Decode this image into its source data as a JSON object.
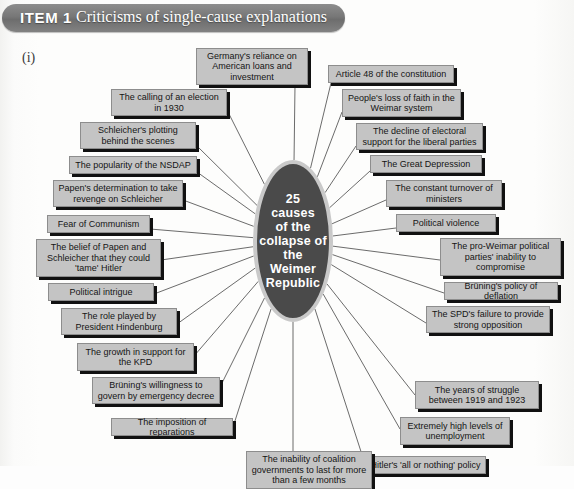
{
  "header": {
    "item_label": "ITEM 1",
    "title": "Criticisms of single-cause explanations",
    "pill_color": "#777777"
  },
  "section_marker": "(i)",
  "diagram": {
    "type": "mind-map",
    "center": {
      "label": "25 causes of the collapse of the Weimer Republic",
      "fill_color": "#4a4a4a",
      "ring_color": "#c9c9c9",
      "text_color": "#ffffff"
    },
    "box_style": {
      "fill_color": "#c4c4c4",
      "border_color": "#8d8d8d",
      "shadow_color": "#111111",
      "text_color": "#141414"
    },
    "causes": [
      {
        "id": "c01",
        "label": "Germany's reliance on American loans and investment",
        "x": 196,
        "y": 14,
        "w": 112,
        "h": 37,
        "anchor_x": 295,
        "anchor_y": 51
      },
      {
        "id": "c02",
        "label": "Article 48 of the constitution",
        "x": 328,
        "y": 31,
        "w": 126,
        "h": 18,
        "anchor_x": 331,
        "anchor_y": 49
      },
      {
        "id": "c03",
        "label": "The calling of an election in 1930",
        "x": 111,
        "y": 55,
        "w": 116,
        "h": 27,
        "anchor_x": 227,
        "anchor_y": 76
      },
      {
        "id": "c04",
        "label": "People's loss of faith in the Weimar system",
        "x": 342,
        "y": 55,
        "w": 119,
        "h": 28,
        "anchor_x": 342,
        "anchor_y": 78
      },
      {
        "id": "c05",
        "label": "Schleicher's plotting behind the scenes",
        "x": 80,
        "y": 88,
        "w": 116,
        "h": 27,
        "anchor_x": 196,
        "anchor_y": 111
      },
      {
        "id": "c06",
        "label": "The decline of electoral support for the liberal parties",
        "x": 356,
        "y": 89,
        "w": 127,
        "h": 27,
        "anchor_x": 356,
        "anchor_y": 112
      },
      {
        "id": "c07",
        "label": "The popularity of the NSDAP",
        "x": 69,
        "y": 122,
        "w": 128,
        "h": 18,
        "anchor_x": 197,
        "anchor_y": 138
      },
      {
        "id": "c08",
        "label": "The Great Depression",
        "x": 370,
        "y": 121,
        "w": 112,
        "h": 18,
        "anchor_x": 370,
        "anchor_y": 137
      },
      {
        "id": "c09",
        "label": "Papen's determination to take revenge on Schleicher",
        "x": 53,
        "y": 146,
        "w": 130,
        "h": 27,
        "anchor_x": 183,
        "anchor_y": 166
      },
      {
        "id": "c10",
        "label": "The constant turnover of ministers",
        "x": 386,
        "y": 146,
        "w": 116,
        "h": 27,
        "anchor_x": 386,
        "anchor_y": 166
      },
      {
        "id": "c11",
        "label": "Fear of Communism",
        "x": 47,
        "y": 181,
        "w": 103,
        "h": 18,
        "anchor_x": 150,
        "anchor_y": 195
      },
      {
        "id": "c12",
        "label": "Political violence",
        "x": 396,
        "y": 180,
        "w": 100,
        "h": 18,
        "anchor_x": 396,
        "anchor_y": 194
      },
      {
        "id": "c13",
        "label": "The belief of Papen and Schleicher that they could 'tame' Hitler",
        "x": 36,
        "y": 205,
        "w": 125,
        "h": 38,
        "anchor_x": 161,
        "anchor_y": 226
      },
      {
        "id": "c14",
        "label": "The pro-Weimar political parties' inability to compromise",
        "x": 440,
        "y": 204,
        "w": 121,
        "h": 38,
        "anchor_x": 440,
        "anchor_y": 226
      },
      {
        "id": "c15",
        "label": "Political intrigue",
        "x": 48,
        "y": 249,
        "w": 106,
        "h": 18,
        "anchor_x": 154,
        "anchor_y": 260
      },
      {
        "id": "c16",
        "label": "Brüning's policy of deflation",
        "x": 444,
        "y": 248,
        "w": 114,
        "h": 18,
        "anchor_x": 444,
        "anchor_y": 259
      },
      {
        "id": "c17",
        "label": "The role played by President Hindenburg",
        "x": 61,
        "y": 274,
        "w": 116,
        "h": 27,
        "anchor_x": 177,
        "anchor_y": 290
      },
      {
        "id": "c18",
        "label": "The SPD's failure to provide strong opposition",
        "x": 426,
        "y": 272,
        "w": 124,
        "h": 27,
        "anchor_x": 426,
        "anchor_y": 289
      },
      {
        "id": "c19",
        "label": "The growth in support for the KPD",
        "x": 77,
        "y": 309,
        "w": 117,
        "h": 28,
        "anchor_x": 194,
        "anchor_y": 322
      },
      {
        "id": "c20",
        "label": "The years of struggle between 1919 and 1923",
        "x": 415,
        "y": 347,
        "w": 124,
        "h": 28,
        "anchor_x": 415,
        "anchor_y": 361
      },
      {
        "id": "c21",
        "label": "Brüning's willingness to govern by emergency decree",
        "x": 92,
        "y": 343,
        "w": 128,
        "h": 27,
        "anchor_x": 220,
        "anchor_y": 353
      },
      {
        "id": "c22",
        "label": "Extremely high levels of unemployment",
        "x": 400,
        "y": 383,
        "w": 110,
        "h": 28,
        "anchor_x": 400,
        "anchor_y": 395
      },
      {
        "id": "c23",
        "label": "The imposition of reparations",
        "x": 111,
        "y": 384,
        "w": 122,
        "h": 18,
        "anchor_x": 233,
        "anchor_y": 393
      },
      {
        "id": "c24",
        "label": "Hitler's 'all or nothing' policy",
        "x": 365,
        "y": 422,
        "w": 121,
        "h": 18,
        "anchor_x": 365,
        "anchor_y": 430
      },
      {
        "id": "c25",
        "label": "The inability of coalition governments to last for more than a few months",
        "x": 246,
        "y": 417,
        "w": 126,
        "h": 38,
        "anchor_x": 293,
        "anchor_y": 417
      }
    ]
  }
}
